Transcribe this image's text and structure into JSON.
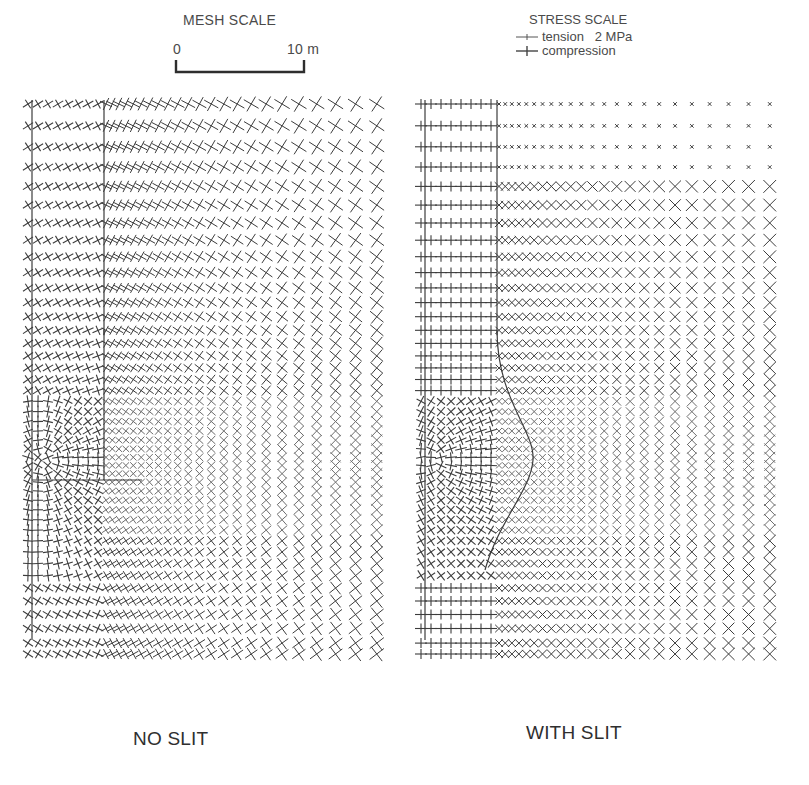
{
  "mesh_scale": {
    "title": "MESH SCALE",
    "start_label": "0",
    "end_label": "10 m"
  },
  "stress_scale": {
    "title": "STRESS SCALE",
    "items": [
      {
        "symbol": "tension",
        "label": "tension   2 MPa"
      },
      {
        "symbol": "compression",
        "label": "compression"
      }
    ]
  },
  "panels": [
    {
      "id": "no-slit",
      "label": "NO SLIT"
    },
    {
      "id": "with-slit",
      "label": "WITH SLIT"
    }
  ],
  "colors": {
    "ink": "#3c3c3c",
    "ink_light": "#6e6e6e",
    "background": "#ffffff"
  }
}
